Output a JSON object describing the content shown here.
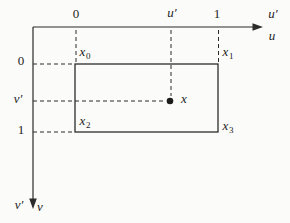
{
  "diagram": {
    "u_axis": {
      "ticks": [
        {
          "label": "0"
        },
        {
          "label": "u′"
        },
        {
          "label": "1"
        }
      ],
      "end_label_prime": "u′",
      "end_label": "u"
    },
    "v_axis": {
      "ticks": [
        {
          "label": "0"
        },
        {
          "label": "v′"
        },
        {
          "label": "1"
        }
      ],
      "end_label_prime": "v′",
      "end_label": "v"
    },
    "corners": [
      {
        "base": "x",
        "sub": "0"
      },
      {
        "base": "x",
        "sub": "1"
      },
      {
        "base": "x",
        "sub": "2"
      },
      {
        "base": "x",
        "sub": "3"
      }
    ],
    "point": {
      "label": "x"
    },
    "colors": {
      "line": "#2b2b2b",
      "background": "#fbfbfa"
    }
  }
}
